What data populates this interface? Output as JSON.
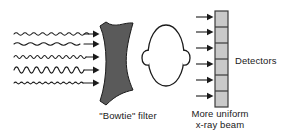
{
  "figure": {
    "background_color": "#ffffff",
    "width": 295,
    "height": 138
  },
  "labels": {
    "bowtie_filter": "\"Bowtie\" filter",
    "beam_line1": "More uniform",
    "beam_line2": "x-ray beam",
    "detectors": "Detectors"
  },
  "colors": {
    "stroke": "#1a1a1a",
    "filter_fill": "#5a5a5a",
    "detector_fill": "#c9c9c9",
    "detector_stroke": "#3a3a3a",
    "background": "#ffffff",
    "text": "#1a1a1a"
  },
  "incoming_beam": {
    "description": "Five wavy arrows representing the non-uniform x-ray beam entering the bowtie filter",
    "arrow_count": 5,
    "waves": [
      {
        "index": 1,
        "y": 34,
        "x_start": 14,
        "x_end": 93,
        "amplitude": 2.6,
        "cycles": 9,
        "label": "wavy-arrow-1"
      },
      {
        "index": 2,
        "y": 44,
        "x_start": 14,
        "x_end": 93,
        "amplitude": 2.2,
        "cycles": 6,
        "label": "wavy-arrow-2"
      },
      {
        "index": 3,
        "y": 57,
        "x_start": 14,
        "x_end": 93,
        "amplitude": 2.8,
        "cycles": 11,
        "label": "wavy-arrow-3"
      },
      {
        "index": 4,
        "y": 70,
        "x_start": 14,
        "x_end": 93,
        "amplitude": 5.4,
        "cycles": 8,
        "label": "wavy-arrow-4"
      },
      {
        "index": 5,
        "y": 83,
        "x_start": 14,
        "x_end": 93,
        "amplitude": 1.6,
        "cycles": 13,
        "label": "wavy-arrow-5"
      }
    ]
  },
  "bowtie_filter": {
    "description": "Dark gray concave bowtie-shaped beam filter",
    "fill": "#5a5a5a",
    "path": "M 97,29 C 104,43 104,76 97,97 L 103,101 L 131,91 C 123,73 123,54 131,24 L 103,34 Z"
  },
  "patient_head": {
    "description": "Outline of a patient head seen from above, with ears",
    "fill": "#ffffff",
    "head_path": "M 166,26 C 178,26 188,40 188,55 C 188,72 178,84 166,84 C 154,84 144,72 144,55 C 144,40 154,26 166,26 Z",
    "ear_left_path": "M 145,53 C 141,53 140,57 140,60 C 140,63 142,66 145,66",
    "ear_right_path": "M 187,53 C 191,53 192,57 192,60 C 192,63 190,66 187,66"
  },
  "outgoing_beam": {
    "description": "Six straight horizontal arrows representing the more uniform x-ray beam exiting toward the detectors",
    "arrow_count": 6,
    "arrows": [
      {
        "index": 1,
        "y": 17,
        "x_start": 196,
        "x_end": 214
      },
      {
        "index": 2,
        "y": 32,
        "x_start": 196,
        "x_end": 214
      },
      {
        "index": 3,
        "y": 48,
        "x_start": 196,
        "x_end": 214
      },
      {
        "index": 4,
        "y": 64,
        "x_start": 196,
        "x_end": 214
      },
      {
        "index": 5,
        "y": 80,
        "x_start": 196,
        "x_end": 214
      },
      {
        "index": 6,
        "y": 96,
        "x_start": 196,
        "x_end": 214
      }
    ]
  },
  "detector_array": {
    "description": "Vertical bar of detector elements",
    "x": 215,
    "y": 11,
    "width": 13,
    "height": 96,
    "fill": "#c9c9c9",
    "stroke": "#3a3a3a",
    "segment_count": 6,
    "segment_boundaries_y": [
      27,
      43,
      59,
      75,
      91
    ]
  }
}
